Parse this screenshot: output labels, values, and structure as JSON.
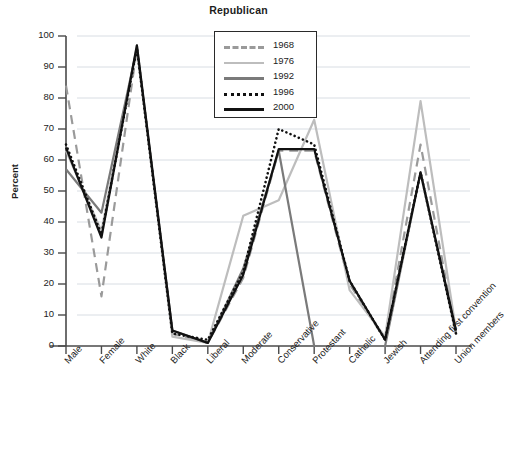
{
  "chart_data": {
    "type": "line",
    "title": "Republican",
    "xlabel": "",
    "ylabel": "Percent",
    "ylim": [
      0,
      100
    ],
    "ytick_values": [
      0,
      10,
      20,
      30,
      40,
      50,
      60,
      70,
      80,
      90,
      100
    ],
    "grid": true,
    "legend_position": "top-center",
    "categories": [
      "Male",
      "Female",
      "White",
      "Black",
      "Liberal",
      "Moderate",
      "Conservative",
      "Protestant",
      "Catholic",
      "Jewish",
      "Attending first convention",
      "Union members"
    ],
    "series": [
      {
        "name": "1968",
        "color": "#9a9a9a",
        "style": "dashed",
        "width": 2.2,
        "values": [
          84,
          16,
          96,
          4,
          1,
          22,
          63,
          63,
          20,
          2,
          65,
          4
        ]
      },
      {
        "name": "1976",
        "color": "#bdbdbd",
        "style": "solid",
        "width": 2.2,
        "values": [
          63,
          37,
          97,
          3,
          1,
          42,
          47,
          73,
          18,
          3,
          79,
          5
        ]
      },
      {
        "name": "1992",
        "color": "#7a7a7a",
        "style": "solid",
        "width": 2.2,
        "values": [
          57,
          43,
          96,
          5,
          1,
          25,
          63,
          0,
          0,
          0,
          56,
          4
        ]
      },
      {
        "name": "1996",
        "color": "#111111",
        "style": "dotted",
        "width": 2.6,
        "values": [
          65,
          36,
          96,
          4,
          2,
          24,
          70,
          65,
          21,
          2,
          56,
          4
        ]
      },
      {
        "name": "2000",
        "color": "#111111",
        "style": "solid",
        "width": 2.2,
        "values": [
          64,
          35,
          97,
          5,
          1,
          23,
          63.5,
          63.5,
          21,
          2,
          56,
          5
        ]
      }
    ]
  }
}
